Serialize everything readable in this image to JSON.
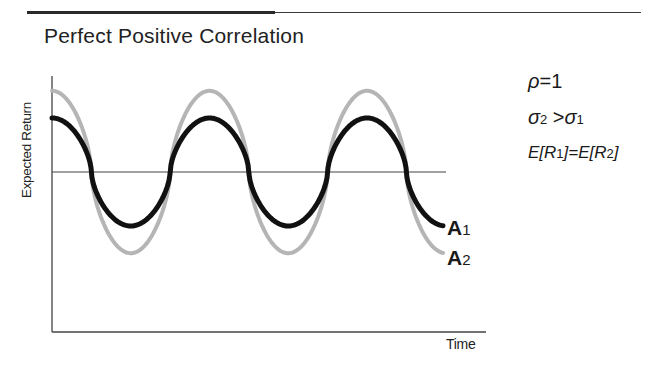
{
  "title": "Perfect Positive Correlation",
  "chart_data": {
    "type": "line",
    "title": "Perfect Positive Correlation",
    "xlabel": "Time",
    "ylabel": "Expected Return",
    "grid": false,
    "x": [
      0,
      0.25,
      0.5,
      0.75,
      1.0,
      1.25,
      1.5,
      1.75,
      2.0,
      2.25,
      2.5,
      2.75
    ],
    "series": [
      {
        "name": "A1",
        "color": "#111111",
        "amplitude": 1.0,
        "values": [
          1.0,
          0,
          -1.0,
          0,
          1.0,
          0,
          -1.0,
          0,
          1.0,
          0,
          -1.0,
          -0.9
        ]
      },
      {
        "name": "A2",
        "color": "#b5b5b5",
        "amplitude": 1.6,
        "values": [
          1.6,
          0,
          -1.6,
          0,
          1.6,
          0,
          -1.6,
          0,
          1.6,
          0,
          -1.6,
          -1.45
        ]
      }
    ],
    "midline": 0,
    "annotations": [
      "ρ = 1",
      "σ2 > σ1",
      "E[R1] = E[R2]"
    ],
    "legend_position": "right-of-curves-end"
  },
  "axes": {
    "xlabel": "Time",
    "ylabel": "Expected Return"
  },
  "legend": {
    "a1": {
      "letter": "A",
      "sub": "1"
    },
    "a2": {
      "letter": "A",
      "sub": "2"
    }
  },
  "annotations": {
    "rho": {
      "sym": "ρ",
      "rest": "=1"
    },
    "sigma": {
      "left": "σ",
      "left_sub": "2",
      "op": " >",
      "right": "σ",
      "right_sub": "1"
    },
    "expect": {
      "e1": "E[R",
      "s1": "1",
      "mid": "]=E[R",
      "s2": "2",
      "end": "]"
    }
  }
}
